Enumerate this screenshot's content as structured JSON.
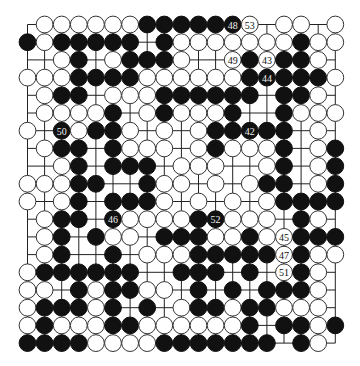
{
  "board": {
    "size": 19,
    "origin_x": 27.5,
    "origin_y": 24.5,
    "step_x": 17.1,
    "step_y": 17.7,
    "stone_radius": 8.4,
    "colors": {
      "black": "#111111",
      "white": "#ffffff",
      "line": "#222222"
    },
    "rows": [
      ".WWWWWWBBBBBBW.WW.W",
      "BWBBBBB.BWWWWWWWBWW",
      "..WB.WBBBW..WBWBBW.",
      "WWWBBBBWWWWWWBBBBBW",
      ".WBB.WWWBBBBBB.BBW.",
      ".WWWWB.WBWWWB..BWWW",
      "W.BWBBW.W.WBBBBB.W.",
      ".WBB.BWWW.WBWWWB.WB",
      "..WB.BBB.WWW..WB.WB",
      "WWWBB..BWW.W.WBB.WB",
      "W.WB.BBBW.W.W.WBBBB",
      ".WBB.BWWWWBBWWW.BW.",
      ".WB.BWW.BBBWWBWWBBB",
      ".WB..B.WWWBBBBBWBWW",
      "WBBBBBB..BBB.B.WBW.",
      "WW.BWBBWW.B.B.BBBW.",
      "WBBBWB.B.WBBWBBWWW.",
      "WBWWWBBWWWWWWB.BBWB",
      "BBBBWWWWBBBBBBB.BW."
    ],
    "numbered_moves": [
      {
        "label": "42",
        "row": 7,
        "col": 14,
        "color": "B"
      },
      {
        "label": "43",
        "row": 3,
        "col": 15,
        "color": "W"
      },
      {
        "label": "44",
        "row": 4,
        "col": 15,
        "color": "B"
      },
      {
        "label": "45",
        "row": 13,
        "col": 16,
        "color": "W"
      },
      {
        "label": "46",
        "row": 12,
        "col": 6,
        "color": "B"
      },
      {
        "label": "47",
        "row": 14,
        "col": 16,
        "color": "W"
      },
      {
        "label": "48",
        "row": 1,
        "col": 13,
        "color": "B"
      },
      {
        "label": "49",
        "row": 3,
        "col": 13,
        "color": "W"
      },
      {
        "label": "50",
        "row": 7,
        "col": 3,
        "color": "B"
      },
      {
        "label": "51",
        "row": 15,
        "col": 16,
        "color": "W"
      },
      {
        "label": "52",
        "row": 12,
        "col": 12,
        "color": "B"
      },
      {
        "label": "53",
        "row": 1,
        "col": 14,
        "color": "W"
      }
    ]
  }
}
